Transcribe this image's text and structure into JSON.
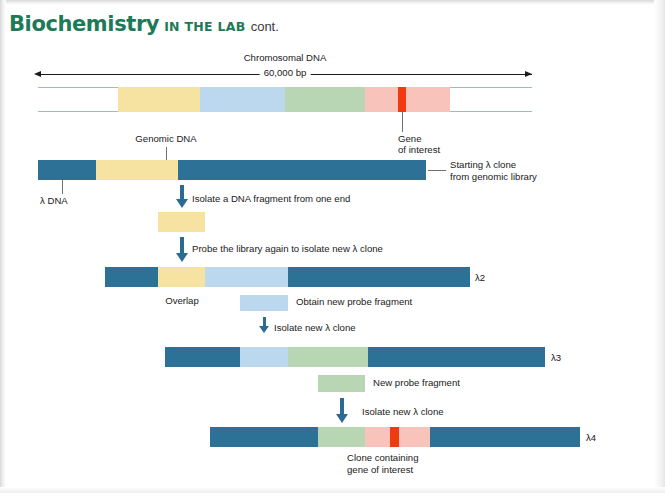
{
  "header": {
    "title": "Biochemistry",
    "subtitle": "IN THE LAB",
    "continued": "cont."
  },
  "colors": {
    "header_green": "#1c7a57",
    "lambda_teal": "#2d7296",
    "genomic_yellow": "#f7e3a1",
    "probe_blue": "#bcd8ee",
    "probe_green": "#b9d6b4",
    "region_pink": "#f8c3ba",
    "gene_red": "#f03b11",
    "arrow_blue": "#2a6a95",
    "rail_blue": "#9fb9cc"
  },
  "chromosome": {
    "title": "Chromosomal DNA",
    "length_label": "60,000 bp",
    "segments": [
      {
        "name": "genomic-yellow",
        "color": "#f7e3a1",
        "x": 118,
        "width": 82
      },
      {
        "name": "probe-blue",
        "color": "#bcd8ee",
        "x": 200,
        "width": 85
      },
      {
        "name": "probe-green",
        "color": "#b9d6b4",
        "x": 285,
        "width": 80
      },
      {
        "name": "region-pink-a",
        "color": "#f8c3ba",
        "x": 365,
        "width": 33
      },
      {
        "name": "gene-of-interest",
        "color": "#f03b11",
        "x": 398,
        "width": 8
      },
      {
        "name": "region-pink-b",
        "color": "#f8c3ba",
        "x": 406,
        "width": 44
      }
    ]
  },
  "annotations": {
    "genomic_dna": "Genomic DNA",
    "gene_of_interest_l1": "Gene",
    "gene_of_interest_l2": "of interest",
    "lambda_dna": "λ DNA",
    "starting_clone_l1": "Starting λ clone",
    "starting_clone_l2": "from genomic library",
    "overlap": "Overlap",
    "obtain_new_probe": "Obtain new probe fragment",
    "new_probe_fragment": "New probe fragment",
    "clone_containing_l1": "Clone containing",
    "clone_containing_l2": "gene of interest"
  },
  "steps": [
    {
      "id": "step-1",
      "label": "Isolate a DNA fragment from one end"
    },
    {
      "id": "step-2",
      "label": "Probe the library again to isolate new λ clone"
    },
    {
      "id": "step-3",
      "label": "Isolate new λ clone"
    },
    {
      "id": "step-4",
      "label": "Isolate new λ clone"
    }
  ],
  "clones": [
    {
      "id": "starting-clone",
      "label": "",
      "x": 38,
      "y": 160,
      "width": 388,
      "segments": [
        {
          "name": "lambda-arm-left",
          "color": "#2d7296",
          "x": 0,
          "width": 58
        },
        {
          "name": "genomic-insert",
          "color": "#f7e3a1",
          "x": 58,
          "width": 82
        },
        {
          "name": "lambda-arm-right",
          "color": "#2d7296",
          "x": 140,
          "width": 248
        }
      ]
    },
    {
      "id": "lambda-2",
      "label": "λ2",
      "x": 105,
      "y": 267,
      "width": 365,
      "segments": [
        {
          "name": "lambda-arm-left",
          "color": "#2d7296",
          "x": 0,
          "width": 53
        },
        {
          "name": "overlap-yellow",
          "color": "#f7e3a1",
          "x": 53,
          "width": 47
        },
        {
          "name": "new-probe-blue",
          "color": "#bcd8ee",
          "x": 100,
          "width": 83
        },
        {
          "name": "lambda-arm-right",
          "color": "#2d7296",
          "x": 183,
          "width": 182
        }
      ]
    },
    {
      "id": "lambda-3",
      "label": "λ3",
      "x": 165,
      "y": 347,
      "width": 380,
      "segments": [
        {
          "name": "lambda-arm-left",
          "color": "#2d7296",
          "x": 0,
          "width": 75
        },
        {
          "name": "overlap-blue",
          "color": "#bcd8ee",
          "x": 75,
          "width": 48
        },
        {
          "name": "new-probe-green",
          "color": "#b9d6b4",
          "x": 123,
          "width": 80
        },
        {
          "name": "lambda-arm-right",
          "color": "#2d7296",
          "x": 203,
          "width": 177
        }
      ]
    },
    {
      "id": "lambda-4",
      "label": "λ4",
      "x": 210,
      "y": 427,
      "width": 370,
      "segments": [
        {
          "name": "lambda-arm-left",
          "color": "#2d7296",
          "x": 0,
          "width": 108
        },
        {
          "name": "overlap-green",
          "color": "#b9d6b4",
          "x": 108,
          "width": 47
        },
        {
          "name": "region-pink-a",
          "color": "#f8c3ba",
          "x": 155,
          "width": 25
        },
        {
          "name": "gene-of-interest",
          "color": "#f03b11",
          "x": 180,
          "width": 9
        },
        {
          "name": "region-pink-b",
          "color": "#f8c3ba",
          "x": 189,
          "width": 31
        },
        {
          "name": "lambda-arm-right",
          "color": "#2d7296",
          "x": 220,
          "width": 150
        }
      ]
    }
  ],
  "fragments": [
    {
      "id": "fragment-yellow",
      "name": "isolated-yellow-fragment",
      "color": "#f7e3a1",
      "x": 158,
      "y": 212,
      "width": 47,
      "height": 20
    },
    {
      "id": "fragment-blue",
      "name": "new-probe-blue-fragment",
      "color": "#bcd8ee",
      "x": 240,
      "y": 295,
      "width": 48,
      "height": 16
    },
    {
      "id": "fragment-green",
      "name": "new-probe-green-fragment",
      "color": "#b9d6b4",
      "x": 318,
      "y": 375,
      "width": 47,
      "height": 17
    }
  ]
}
